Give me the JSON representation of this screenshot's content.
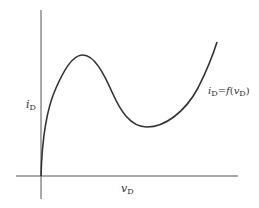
{
  "diagram": {
    "type": "i-v characteristic curve",
    "axes": {
      "y_label_var": "i",
      "y_label_sub": "D",
      "x_label_var": "v",
      "x_label_sub": "D"
    },
    "curve_label": {
      "lhs_var": "i",
      "lhs_sub": "D",
      "eq": "=",
      "func": "f",
      "open": "(",
      "arg_var": "v",
      "arg_sub": "D",
      "close": ")"
    },
    "colors": {
      "axis": "#555555",
      "curve": "#333333",
      "text": "#333333"
    }
  }
}
